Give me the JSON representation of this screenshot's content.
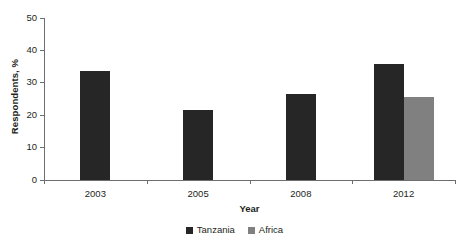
{
  "chart_data": {
    "type": "bar",
    "title": "",
    "xlabel": "Year",
    "ylabel": "Respondents, %",
    "categories": [
      "2003",
      "2005",
      "2008",
      "2012"
    ],
    "series": [
      {
        "name": "Tanzania",
        "color": "#262626",
        "values": [
          33.5,
          21.7,
          26.7,
          35.7
        ]
      },
      {
        "name": "Africa",
        "color": "#808080",
        "values": [
          null,
          null,
          null,
          25.6
        ]
      }
    ],
    "ylim": [
      0,
      50
    ],
    "yticks": [
      0,
      10,
      20,
      30,
      40,
      50
    ],
    "ytick_labels": [
      "0",
      "10",
      "20",
      "30",
      "40",
      "50"
    ],
    "grid": false,
    "legend_position": "bottom-center"
  },
  "axes": {
    "y_title": "Respondents, %",
    "x_title": "Year"
  },
  "legend": {
    "items": [
      {
        "label": "Tanzania",
        "color": "#262626"
      },
      {
        "label": "Africa",
        "color": "#808080"
      }
    ]
  }
}
